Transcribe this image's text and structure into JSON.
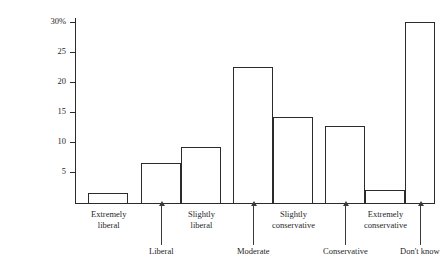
{
  "chart_data": {
    "type": "bar",
    "title": "",
    "xlabel": "",
    "ylabel": "Percent of Public",
    "ylim": [
      0,
      30
    ],
    "grid": false,
    "legend": "none",
    "y_ticks": [
      {
        "value": 5,
        "label": "5"
      },
      {
        "value": 10,
        "label": "10"
      },
      {
        "value": 15,
        "label": "15"
      },
      {
        "value": 20,
        "label": "20"
      },
      {
        "value": 25,
        "label": "25"
      },
      {
        "value": 30,
        "label": "30%"
      }
    ],
    "categories": [
      "Extremely liberal",
      "Liberal",
      "Slightly liberal",
      "Moderate",
      "Slightly conservative",
      "Conservative",
      "Extremely conservative",
      "Don't know"
    ],
    "values": [
      1.7,
      6.7,
      9.4,
      22.7,
      14.3,
      12.9,
      2.1,
      30.2
    ],
    "bars": [
      {
        "label_line1": "Extremely",
        "label_line2": "liberal",
        "value": 1.7,
        "row": 1
      },
      {
        "label_line1": "Liberal",
        "label_line2": "",
        "value": 6.7,
        "row": 2
      },
      {
        "label_line1": "Slightly",
        "label_line2": "liberal",
        "value": 9.4,
        "row": 1
      },
      {
        "label_line1": "Moderate",
        "label_line2": "",
        "value": 22.7,
        "row": 2
      },
      {
        "label_line1": "Slightly",
        "label_line2": "conservative",
        "value": 14.3,
        "row": 1
      },
      {
        "label_line1": "Conservative",
        "label_line2": "",
        "value": 12.9,
        "row": 2
      },
      {
        "label_line1": "Extremely",
        "label_line2": "conservative",
        "value": 2.1,
        "row": 1
      },
      {
        "label_line1": "Don't know",
        "label_line2": "",
        "value": 30.2,
        "row": 2
      }
    ],
    "colors": {
      "bar_fill": "#ffffff",
      "bar_stroke": "#2b2b2b",
      "axis": "#2b2b2b",
      "text": "#1f1f1f",
      "background": "#ffffff"
    }
  }
}
